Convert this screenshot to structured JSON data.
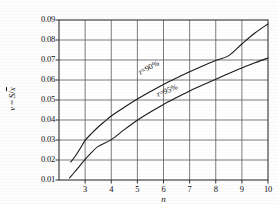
{
  "chart_data": {
    "type": "line",
    "title": "",
    "subtitle": "",
    "xlabel": "n",
    "ylabel": "v = S/x̄",
    "ylabel_plain": "v = S/x",
    "xlim": [
      2,
      10
    ],
    "ylim": [
      0.01,
      0.09
    ],
    "grid": true,
    "legend_position": "inline-on-curves",
    "x_ticks": [
      3,
      4,
      5,
      6,
      7,
      8,
      9,
      10
    ],
    "x_tick_labels": [
      "3",
      "4",
      "5",
      "6",
      "7",
      "8",
      "9",
      "10"
    ],
    "y_ticks": [
      0.01,
      0.02,
      0.03,
      0.04,
      0.05,
      0.06,
      0.07,
      0.08,
      0.09
    ],
    "y_tick_labels": [
      "0.01",
      "0.02",
      "0.03",
      "0.04",
      "0.05",
      "0.06",
      "0.07",
      "0.08",
      "0.09"
    ],
    "annotations": [
      {
        "text": "r=90%",
        "x": 5.05,
        "y": 0.0635,
        "rotation": -27
      },
      {
        "text": "r=95%",
        "x": 5.75,
        "y": 0.0525,
        "rotation": -22
      }
    ],
    "series": [
      {
        "name": "r=90%",
        "label": "r=90%",
        "color": "#1a1a1a",
        "x": [
          2.45,
          2.6,
          2.8,
          3.0,
          3.25,
          3.5,
          3.75,
          4.0,
          4.5,
          5.0,
          5.5,
          6.0,
          6.5,
          7.0,
          7.5,
          8.0,
          8.5,
          9.0,
          9.5,
          10.0
        ],
        "y": [
          0.019,
          0.0215,
          0.0255,
          0.0298,
          0.0333,
          0.0365,
          0.0393,
          0.042,
          0.0464,
          0.0505,
          0.0542,
          0.0578,
          0.061,
          0.0641,
          0.067,
          0.0697,
          0.0722,
          0.078,
          0.0835,
          0.088
        ]
      },
      {
        "name": "r=95%",
        "label": "r=95%",
        "color": "#1a1a1a",
        "x": [
          2.4,
          2.6,
          2.8,
          3.0,
          3.25,
          3.5,
          4.0,
          4.5,
          5.0,
          5.5,
          6.0,
          6.5,
          7.0,
          7.5,
          8.0,
          8.5,
          9.0,
          9.5,
          10.0
        ],
        "y": [
          0.011,
          0.014,
          0.0172,
          0.0203,
          0.0238,
          0.0268,
          0.0302,
          0.0352,
          0.0399,
          0.044,
          0.0478,
          0.0512,
          0.0545,
          0.0575,
          0.0604,
          0.0633,
          0.066,
          0.0686,
          0.071
        ]
      }
    ]
  },
  "figure": {
    "background_color": "#fdfdfd",
    "line_color": "#1a1a1a",
    "grid_color": "#5a5a5a",
    "axis_color": "#333333"
  }
}
